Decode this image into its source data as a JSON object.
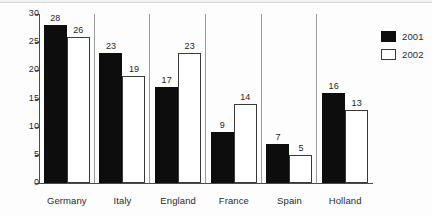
{
  "chart_data": {
    "type": "bar",
    "title": "",
    "subtitle": "",
    "xlabel": "",
    "ylabel": "",
    "categories": [
      "Germany",
      "Italy",
      "England",
      "France",
      "Spain",
      "Holland"
    ],
    "series": [
      {
        "name": "2001",
        "color": "#0d0d0d",
        "fill": "solid",
        "values": [
          28,
          23,
          17,
          9,
          7,
          16
        ]
      },
      {
        "name": "2002",
        "color": "#ffffff",
        "fill": "outline",
        "values": [
          26,
          19,
          23,
          14,
          5,
          13
        ]
      }
    ],
    "yticks": [
      0,
      5,
      10,
      15,
      20,
      25,
      30
    ],
    "ytick_labels": [
      "0",
      "5",
      "10",
      "15",
      "20",
      "25",
      "30"
    ],
    "ylim": [
      0,
      30
    ],
    "grid": false,
    "data_labels": true,
    "legend_position": "top-right",
    "legend_entries": [
      "2001",
      "2002"
    ]
  },
  "axis": {
    "line_color": "#4a4a4a"
  }
}
